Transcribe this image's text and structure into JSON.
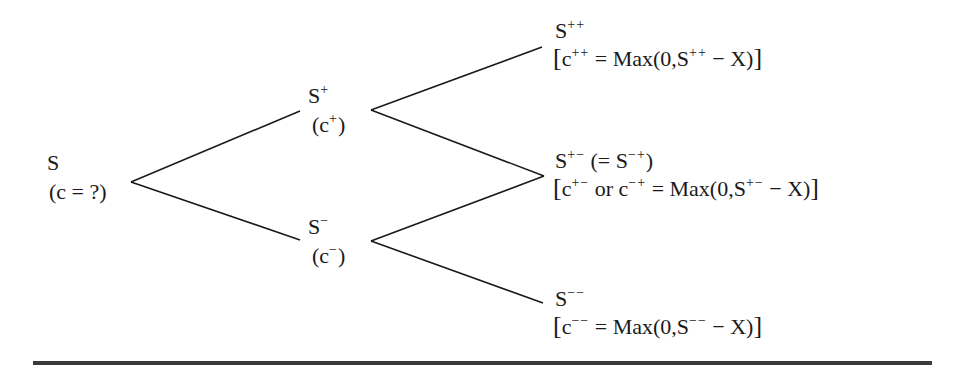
{
  "diagram": {
    "type": "binomial-option-pricing-tree",
    "nodes": {
      "root": {
        "price": "S",
        "value": "(c = ?)"
      },
      "up": {
        "price_base": "S",
        "price_sup": "+",
        "value_open": "(c",
        "value_sup": "+",
        "value_close": ")"
      },
      "down": {
        "price_base": "S",
        "price_sup": "−",
        "value_open": "(c",
        "value_sup": "−",
        "value_close": ")"
      },
      "upup": {
        "price_base": "S",
        "price_sup": "++",
        "payoff": {
          "open": "[",
          "c": "c",
          "c_sup": "++",
          "eq": " = Max(0,S",
          "s_sup": "++",
          "tail": " − X)",
          "close": "]"
        }
      },
      "updown": {
        "price_base": "S",
        "price_sup": "+−",
        "equiv_open": " (= S",
        "equiv_sup": "−+",
        "equiv_close": ")",
        "payoff": {
          "open": "[",
          "c": "c",
          "c_sup": "+−",
          "or": " or c",
          "or_sup": "−+",
          "eq": " = Max(0,S",
          "s_sup": "+−",
          "tail": " − X)",
          "close": "]"
        }
      },
      "downdown": {
        "price_base": "S",
        "price_sup": "−−",
        "payoff": {
          "open": "[",
          "c": "c",
          "c_sup": "−−",
          "eq": " = Max(0,S",
          "s_sup": "−−",
          "tail": " − X)",
          "close": "]"
        }
      }
    },
    "edges": [
      {
        "from": "root",
        "to": "up"
      },
      {
        "from": "root",
        "to": "down"
      },
      {
        "from": "up",
        "to": "upup"
      },
      {
        "from": "up",
        "to": "updown"
      },
      {
        "from": "down",
        "to": "updown"
      },
      {
        "from": "down",
        "to": "downdown"
      }
    ],
    "colors": {
      "ink": "#1a1a1a",
      "rule": "#3a3a3a"
    }
  }
}
